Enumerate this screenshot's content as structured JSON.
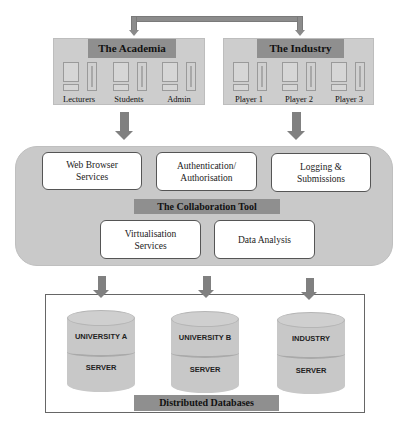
{
  "diagram": {
    "top_connector": {
      "label": "bidirectional-link",
      "arrows": 2
    },
    "academia": {
      "title": "The Academia",
      "members": [
        {
          "label": "Lecturers"
        },
        {
          "label": "Students"
        },
        {
          "label": "Admin"
        }
      ]
    },
    "industry": {
      "title": "The Industry",
      "members": [
        {
          "label": "Player 1"
        },
        {
          "label": "Player 2"
        },
        {
          "label": "Player 3"
        }
      ]
    },
    "collaboration_tool": {
      "title": "The Collaboration Tool",
      "services_top": [
        {
          "line1": "Web Browser",
          "line2": "Services"
        },
        {
          "line1": "Authentication/",
          "line2": "Authorisation"
        },
        {
          "line1": "Logging &",
          "line2": "Submissions"
        }
      ],
      "services_bottom": [
        {
          "line1": "Virtualisation",
          "line2": "Services"
        },
        {
          "line1": "Data Analysis",
          "line2": ""
        }
      ]
    },
    "databases": {
      "title": "Distributed Databases",
      "servers": [
        {
          "top": "UNIVERSITY A",
          "bottom": "SERVER"
        },
        {
          "top": "UNIVERSITY B",
          "bottom": "SERVER"
        },
        {
          "top": "INDUSTRY",
          "bottom": "SERVER"
        }
      ]
    },
    "colors": {
      "panel_fill": "#cdcdcd",
      "header_fill": "#8f8f8f",
      "arrow": "#808080",
      "service_box": "#ffffff"
    }
  }
}
